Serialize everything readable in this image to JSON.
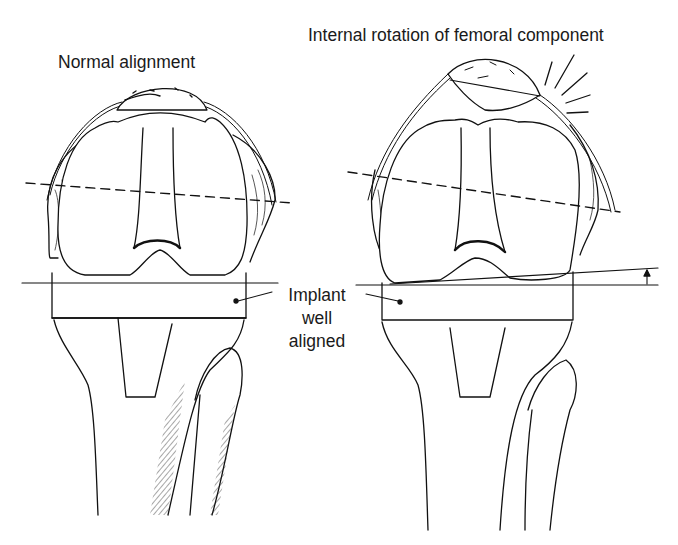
{
  "figure": {
    "panels": [
      {
        "id": "left",
        "title": "Normal alignment",
        "depicts": "knee prosthesis, femoral component in normal alignment with tibial tray"
      },
      {
        "id": "right",
        "title": "Internal rotation of femoral component",
        "depicts": "knee prosthesis, femoral component internally rotated causing patellar maltracking / tilt (pain lines shown)"
      }
    ],
    "shared_annotation": {
      "lines": [
        "Implant",
        "well",
        "aligned"
      ]
    },
    "colors": {
      "ink": "#111111",
      "background": "#ffffff"
    }
  }
}
